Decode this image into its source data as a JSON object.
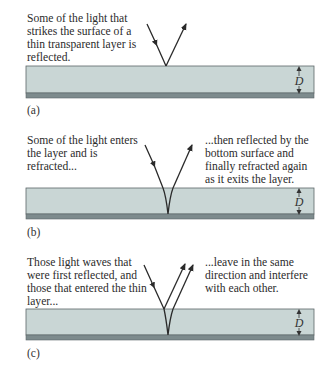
{
  "figure": {
    "panels": [
      {
        "id": "a",
        "label": "(a)",
        "left_caption": "Some of the light that\nstrikes the surface of a\nthin transparent layer is\nreflected.",
        "right_caption": "",
        "thickness_label": "D"
      },
      {
        "id": "b",
        "label": "(b)",
        "left_caption": "Some of the light enters\nthe layer and is\nrefracted...",
        "right_caption": "...then reflected by the\nbottom surface and\nfinally refracted again\nas it exits the layer.",
        "thickness_label": "D"
      },
      {
        "id": "c",
        "label": "(c)",
        "left_caption": "Those light waves that\nwere first reflected, and\nthose that entered the thin\nlayer...",
        "right_caption": "...leave in the same\ndirection and interfere\nwith each other.",
        "thickness_label": "D"
      }
    ],
    "colors": {
      "layer_fill": "#c9d6d5",
      "layer_bottom": "#7d8b8d",
      "layer_border": "#5c6668",
      "ray": "#2a2a2a"
    }
  }
}
